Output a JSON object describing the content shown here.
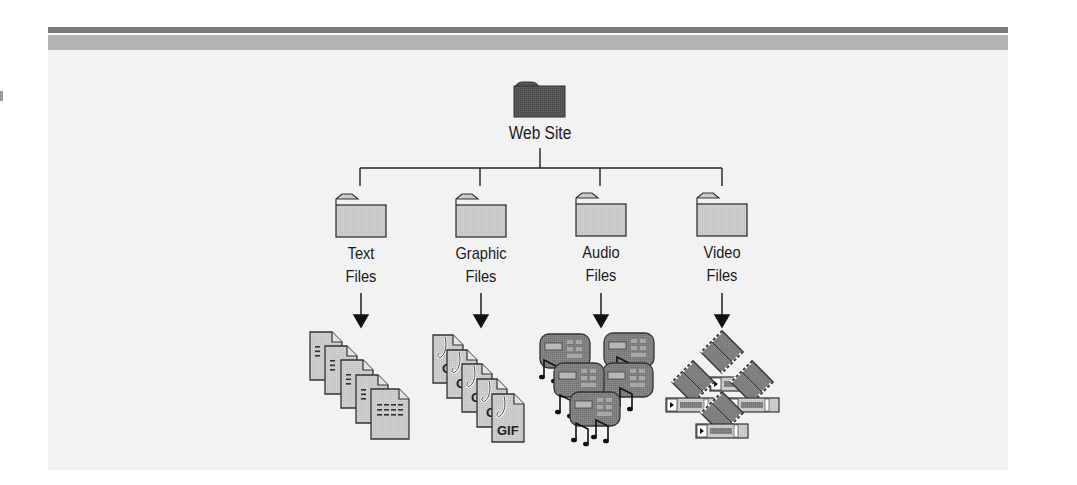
{
  "diagram": {
    "root": {
      "label": "Web Site",
      "icon": "folder-dark-icon"
    },
    "children": [
      {
        "label_line1": "Text",
        "label_line2": "Files",
        "folder_icon": "folder-icon",
        "content_icon": "text-document-stack-icon"
      },
      {
        "label_line1": "Graphic",
        "label_line2": "Files",
        "folder_icon": "folder-icon",
        "content_icon": "gif-file-stack-icon",
        "file_badge": "GIF"
      },
      {
        "label_line1": "Audio",
        "label_line2": "Files",
        "folder_icon": "folder-icon",
        "content_icon": "audio-player-cluster-icon"
      },
      {
        "label_line1": "Video",
        "label_line2": "Files",
        "folder_icon": "folder-icon",
        "content_icon": "video-filmstrip-cluster-icon"
      }
    ],
    "colors": {
      "panel_bg": "#f2f2f2",
      "rule_dark": "#7a7a7a",
      "rule_light": "#b3b3b3",
      "root_folder": "#555555",
      "child_folder": "#cfcfcf",
      "line": "#222222",
      "media_dark": "#7d7d7d"
    }
  }
}
